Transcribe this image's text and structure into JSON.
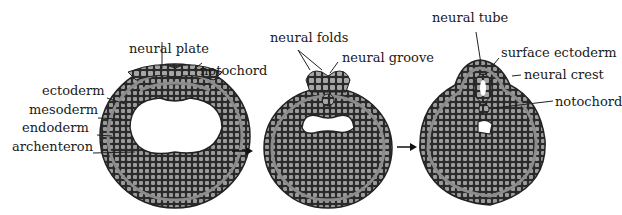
{
  "diagram": {
    "stage1": {
      "labels": {
        "neural_plate": "neural plate",
        "notochord": "notochord",
        "ectoderm": "ectoderm",
        "mesoderm": "mesoderm",
        "endoderm": "endoderm",
        "archenteron": "archenteron"
      }
    },
    "stage2": {
      "labels": {
        "neural_folds": "neural folds",
        "neural_groove": "neural groove"
      }
    },
    "stage3": {
      "labels": {
        "neural_tube": "neural tube",
        "surface_ectoderm": "surface ectoderm",
        "neural_crest": "neural crest",
        "notochord": "notochord"
      }
    },
    "colors": {
      "cell_dark": "#2a2a2a",
      "cell_light": "#9a9a9a",
      "layer_gray": "#8c8c8c",
      "background": "#ffffff",
      "text": "#1a1a1a"
    }
  }
}
